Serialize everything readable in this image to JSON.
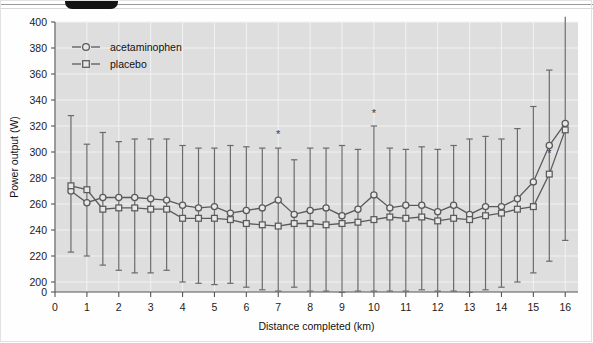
{
  "figure": {
    "background_color": "#fefefe",
    "plot_background_color": "#dedede",
    "line_color": "#5a5a5a",
    "marker_fill": "#e8e8e8",
    "gridline_color": "#f2f2f2",
    "axis_color": "#555555",
    "tab_color": "#131313"
  },
  "chart_data": {
    "type": "line",
    "title": "",
    "xlabel": "Distance completed (km)",
    "ylabel": "Power output (W)",
    "xlim": [
      0,
      16.4
    ],
    "ylim": [
      190,
      400
    ],
    "xticks": [
      0,
      1,
      2,
      3,
      4,
      5,
      6,
      7,
      8,
      9,
      10,
      11,
      12,
      13,
      14,
      15,
      16
    ],
    "xticklabels": [
      "0",
      "1",
      "2",
      "3",
      "4",
      "5",
      "6",
      "7",
      "8",
      "9",
      "10",
      "11",
      "12",
      "13",
      "14",
      "15",
      "16"
    ],
    "yticks": [
      0,
      200,
      220,
      240,
      260,
      280,
      300,
      320,
      340,
      360,
      380,
      400
    ],
    "yticklabels": [
      "0",
      "200",
      "220",
      "240",
      "260",
      "280",
      "300",
      "320",
      "340",
      "360",
      "380",
      "400"
    ],
    "y_axis_broken": true,
    "grid": true,
    "legend_position": "top-left",
    "errorbars": "SD",
    "x": [
      0.5,
      1.0,
      1.5,
      2.0,
      2.5,
      3.0,
      3.5,
      4.0,
      4.5,
      5.0,
      5.5,
      6.0,
      6.5,
      7.0,
      7.5,
      8.0,
      8.5,
      9.0,
      9.5,
      10.0,
      10.5,
      11.0,
      11.5,
      12.0,
      12.5,
      13.0,
      13.5,
      14.0,
      14.5,
      15.0,
      15.5,
      16.0
    ],
    "series": [
      {
        "name": "acetaminophen",
        "marker": "circle",
        "values": [
          270,
          261,
          265,
          265,
          265,
          264,
          263,
          259,
          257,
          258,
          253,
          255,
          257,
          263,
          252,
          255,
          257,
          251,
          256,
          267,
          257,
          259,
          259,
          254,
          259,
          252,
          258,
          258,
          264,
          277,
          305,
          322
        ],
        "err_upper": [
          328,
          306,
          315,
          308,
          310,
          310,
          310,
          305,
          303,
          303,
          305,
          304,
          303,
          303,
          294,
          303,
          303,
          305,
          302,
          320,
          303,
          302,
          304,
          302,
          305,
          310,
          312,
          310,
          318,
          335,
          363,
          404
        ],
        "err_lower": [
          223,
          220,
          213,
          209,
          207,
          207,
          209,
          200,
          199,
          198,
          199,
          196,
          194,
          193,
          196,
          193,
          193,
          192,
          193,
          193,
          193,
          193,
          194,
          193,
          193,
          192,
          194,
          196,
          200,
          207,
          216,
          232
        ]
      },
      {
        "name": "placebo",
        "marker": "square",
        "values": [
          274,
          271,
          256,
          257,
          257,
          256,
          256,
          249,
          249,
          249,
          248,
          245,
          244,
          243,
          245,
          245,
          244,
          245,
          246,
          248,
          250,
          249,
          250,
          247,
          249,
          248,
          251,
          253,
          256,
          258,
          283,
          317
        ],
        "err_upper": [
          328,
          306,
          315,
          308,
          310,
          310,
          310,
          305,
          303,
          303,
          305,
          304,
          303,
          303,
          294,
          303,
          303,
          305,
          302,
          320,
          303,
          302,
          304,
          302,
          305,
          310,
          312,
          310,
          318,
          335,
          363,
          404
        ],
        "err_lower": [
          223,
          220,
          213,
          209,
          207,
          207,
          209,
          200,
          199,
          198,
          199,
          196,
          194,
          193,
          196,
          193,
          193,
          192,
          193,
          193,
          193,
          193,
          194,
          193,
          193,
          192,
          194,
          196,
          200,
          207,
          216,
          232
        ]
      }
    ],
    "annotations": [
      {
        "label": "*",
        "x": 7.0,
        "y": 311
      },
      {
        "label": "*",
        "x": 10.0,
        "y": 327
      },
      {
        "label": "*",
        "x": 15.5,
        "y": 296
      }
    ]
  },
  "legend": {
    "items": [
      {
        "label": "acetaminophen",
        "marker": "circle"
      },
      {
        "label": "placebo",
        "marker": "square"
      }
    ]
  }
}
